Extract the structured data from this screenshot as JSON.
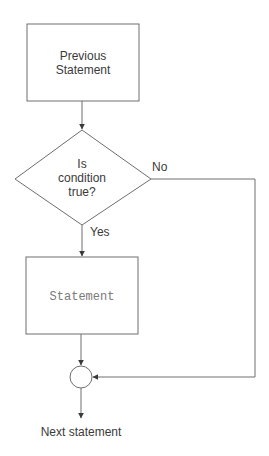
{
  "diagram": {
    "type": "flowchart",
    "title": "",
    "nodes": {
      "previous": {
        "shape": "rectangle",
        "label_line1": "Previous",
        "label_line2": "Statement"
      },
      "decision": {
        "shape": "diamond",
        "label_line1": "Is",
        "label_line2": "condition",
        "label_line3": "true?"
      },
      "statement": {
        "shape": "rectangle",
        "label": "Statement"
      },
      "junction": {
        "shape": "circle"
      },
      "next": {
        "shape": "text",
        "label": "Next statement"
      }
    },
    "edges": [
      {
        "from": "previous",
        "to": "decision",
        "label": ""
      },
      {
        "from": "decision",
        "to": "statement",
        "label": "Yes"
      },
      {
        "from": "decision",
        "to": "junction",
        "label": "No"
      },
      {
        "from": "statement",
        "to": "junction",
        "label": ""
      },
      {
        "from": "junction",
        "to": "next",
        "label": ""
      }
    ],
    "edge_labels": {
      "yes": "Yes",
      "no": "No"
    },
    "colors": {
      "stroke": "#6e6e6e",
      "text": "#3a3a3a",
      "mono_text": "#7a7a7a",
      "background": "#ffffff"
    }
  }
}
